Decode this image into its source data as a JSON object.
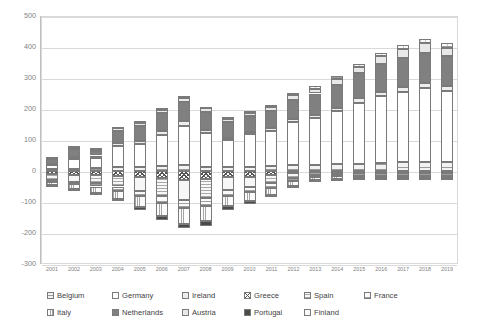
{
  "chart_data": {
    "type": "bar",
    "stacked": true,
    "title": "",
    "xlabel": "",
    "ylabel": "",
    "ylim": [
      -300,
      500
    ],
    "ytick_step": 100,
    "yticks": [
      "500",
      "400",
      "300",
      "200",
      "100",
      "0",
      "-100",
      "-200",
      "-300"
    ],
    "grid": true,
    "legend_position": "bottom",
    "categories": [
      "2001",
      "2002",
      "2003",
      "2004",
      "2005",
      "2006",
      "2007",
      "2008",
      "2009",
      "2010",
      "2011",
      "2012",
      "2013",
      "2014",
      "2015",
      "2016",
      "2017",
      "2018",
      "2019"
    ],
    "series": [
      {
        "name": "Belgium",
        "pattern": "horizontal-lines-light",
        "values": [
          6,
          8,
          9,
          12,
          14,
          16,
          18,
          14,
          12,
          14,
          16,
          18,
          20,
          22,
          24,
          26,
          28,
          30,
          28
        ]
      },
      {
        "name": "Germany",
        "pattern": "solid-white",
        "values": [
          14,
          30,
          33,
          68,
          72,
          100,
          128,
          108,
          88,
          104,
          112,
          140,
          150,
          170,
          196,
          216,
          228,
          238,
          230
        ]
      },
      {
        "name": "Ireland",
        "pattern": "grid-small",
        "values": [
          4,
          6,
          8,
          10,
          12,
          14,
          16,
          10,
          8,
          8,
          10,
          10,
          12,
          12,
          14,
          14,
          16,
          16,
          16
        ]
      },
      {
        "name": "Greece",
        "pattern": "checker-dark",
        "values": [
          -10,
          -12,
          -14,
          -16,
          -20,
          -24,
          -28,
          -26,
          -20,
          -18,
          -14,
          -8,
          -4,
          -3,
          -3,
          -3,
          -3,
          -3,
          -3
        ]
      },
      {
        "name": "Spain",
        "pattern": "horizontal-lines-mid",
        "values": [
          -18,
          -22,
          -26,
          -34,
          -44,
          -56,
          -66,
          -62,
          -42,
          -34,
          -26,
          -14,
          -8,
          -6,
          -5,
          -5,
          -5,
          -5,
          -5
        ]
      },
      {
        "name": "France",
        "pattern": "horizontal-lines-wide",
        "values": [
          -6,
          -8,
          -10,
          -14,
          -18,
          -22,
          -26,
          -24,
          -18,
          -16,
          -14,
          -10,
          -8,
          -8,
          -8,
          -8,
          -8,
          -8,
          -8
        ]
      },
      {
        "name": "Italy",
        "pattern": "vertical-lines",
        "values": [
          -12,
          -16,
          -20,
          -26,
          -34,
          -42,
          -50,
          -48,
          -34,
          -28,
          -24,
          -16,
          -10,
          -8,
          -7,
          -7,
          -7,
          -7,
          -7
        ]
      },
      {
        "name": "Netherlands",
        "pattern": "solid-gray",
        "values": [
          16,
          28,
          16,
          40,
          48,
          56,
          60,
          58,
          50,
          52,
          56,
          62,
          68,
          74,
          82,
          90,
          94,
          98,
          96
        ]
      },
      {
        "name": "Austria",
        "pattern": "grid-mid",
        "values": [
          4,
          6,
          6,
          8,
          10,
          12,
          14,
          12,
          10,
          10,
          12,
          14,
          16,
          18,
          20,
          24,
          28,
          30,
          28
        ]
      },
      {
        "name": "Portugal",
        "pattern": "solid-dark",
        "values": [
          -4,
          -5,
          -6,
          -8,
          -10,
          -13,
          -15,
          -16,
          -11,
          -9,
          -7,
          -5,
          -3,
          -3,
          -3,
          -3,
          -3,
          -3,
          -3
        ]
      },
      {
        "name": "Finland",
        "pattern": "grid-fine",
        "values": [
          2,
          3,
          3,
          4,
          5,
          6,
          7,
          6,
          5,
          5,
          6,
          7,
          8,
          9,
          10,
          12,
          14,
          15,
          14
        ]
      }
    ],
    "totals_positive": [
      46,
      81,
      75,
      174,
      166,
      218,
      241,
      196,
      188,
      211,
      228,
      268,
      299,
      331,
      364,
      394,
      422,
      438,
      420
    ],
    "totals_negative": [
      -50,
      -63,
      -76,
      -98,
      -126,
      -157,
      -185,
      -176,
      -125,
      -105,
      -85,
      -53,
      -33,
      -28,
      -26,
      -26,
      -26,
      -26,
      -26
    ]
  },
  "legend": {
    "row1": [
      {
        "label": "Belgium",
        "key": "belgium"
      },
      {
        "label": "Germany",
        "key": "germany"
      },
      {
        "label": "Ireland",
        "key": "ireland"
      },
      {
        "label": "Greece",
        "key": "greece"
      },
      {
        "label": "Spain",
        "key": "spain"
      },
      {
        "label": "France",
        "key": "france"
      }
    ],
    "row2": [
      {
        "label": "Italy",
        "key": "italy"
      },
      {
        "label": "Netherlands",
        "key": "netherlands"
      },
      {
        "label": "Austria",
        "key": "austria"
      },
      {
        "label": "Portugal",
        "key": "portugal"
      },
      {
        "label": "Finland",
        "key": "finland"
      }
    ]
  },
  "colors": {
    "grid": "#d9d9d9",
    "axis_text": "#7f7f7f",
    "legend_text": "#3f3f3f",
    "bar_outline": "#7a7a7a",
    "plot_border": "#d9d9d9",
    "background": "#ffffff"
  }
}
